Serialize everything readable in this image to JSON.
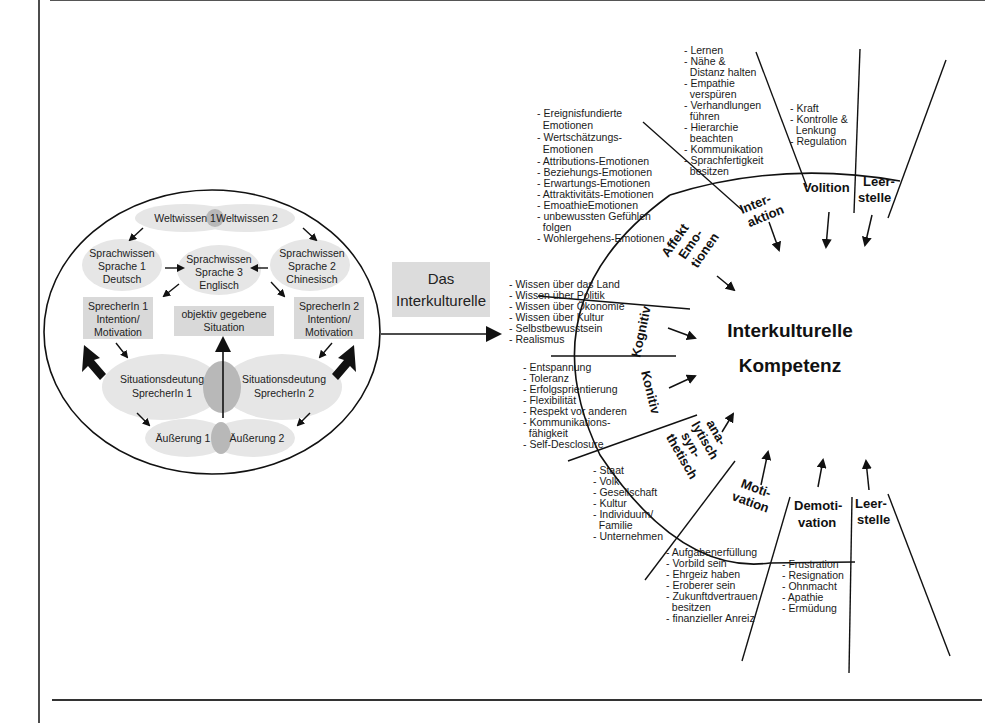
{
  "left_diagram": {
    "weltwissen_1": "Weltwissen 1",
    "weltwissen_2": "Weltwissen 2",
    "sprachwissen_1": [
      "Sprachwissen",
      "Sprache 1",
      "Deutsch"
    ],
    "sprachwissen_3": [
      "Sprachwissen",
      "Sprache 3",
      "Englisch"
    ],
    "sprachwissen_2": [
      "Sprachwissen",
      "Sprache 2",
      "Chinesisch"
    ],
    "sprecherin_1": [
      "SprecherIn 1",
      "Intention/",
      "Motivation"
    ],
    "situation": [
      "objektiv gegebene",
      "Situation"
    ],
    "sprecherin_2": [
      "SprecherIn 2",
      "Intention/",
      "Motivation"
    ],
    "deutung_1": [
      "Situationsdeutung",
      "SprecherIn 1"
    ],
    "deutung_2": [
      "Situationsdeutung",
      "SprecherIn 2"
    ],
    "aeusserung_1": "Äußerung 1",
    "aeusserung_2": "Äußerung 2"
  },
  "connector": {
    "label": [
      "Das",
      "Interkulturelle"
    ]
  },
  "center": {
    "title": [
      "Interkulturelle",
      "Kompetenz"
    ]
  },
  "segments": {
    "kognitiv": "Kognitiv",
    "konitiv": "Konitiv",
    "affekt": [
      "Affekt",
      "Emo-",
      "tionen"
    ],
    "interaktion": [
      "Inter-",
      "aktion"
    ],
    "volition": "Volition",
    "leerstelle_top": [
      "Leer-",
      "stelle"
    ],
    "analytisch": [
      "ana-",
      "lytisch",
      "syn-",
      "thetisch"
    ],
    "motivation": [
      "Moti-",
      "vation"
    ],
    "demotivation": [
      "Demoti-",
      "vation"
    ],
    "leerstelle_bottom": [
      "Leer-",
      "stelle"
    ]
  },
  "lists": {
    "affekt": [
      "- Ereignisfundierte",
      "  Emotionen",
      "- Wertschätzungs-",
      "  Emotionen",
      "- Attributions-Emotionen",
      "- Beziehungs-Emotionen",
      "- Erwartungs-Emotionen",
      "- Attraktivitäts-Emotionen",
      "- EmoathieEmotionen",
      "- unbewussten Gefühlen",
      "  folgen",
      "- Wohlergehens-Emotionen"
    ],
    "interaktion": [
      "- Lernen",
      "- Nähe &",
      "  Distanz halten",
      "- Empathie",
      "  verspüren",
      "- Verhandlungen",
      "  führen",
      "- Hierarchie",
      "  beachten",
      "- Kommunikation",
      "- Sprachfertigkeit",
      "  besitzen"
    ],
    "volition": [
      "- Kraft",
      "- Kontrolle &",
      "  Lenkung",
      "- Regulation"
    ],
    "kognitiv": [
      "- Wissen über das Land",
      "- Wissen über Politik",
      "- Wissen über Ökonomie",
      "- Wissen über Kultur",
      "- Selbstbewusstsein",
      "- Realismus"
    ],
    "konitiv": [
      "- Entspannung",
      "- Toleranz",
      "- Erfolgsprientierung",
      "- Flexibilität",
      "- Respekt vor anderen",
      "- Kommunikations-",
      "  fähigkeit",
      "- Self-Desclosure"
    ],
    "analytisch": [
      "- Staat",
      "- Volk",
      "- Gesellschaft",
      "- Kultur",
      "- Individuum/",
      "  Familie",
      "- Unternehmen"
    ],
    "motivation": [
      "- Aufgabenerfüllung",
      "- Vorbild sein",
      "- Ehrgeiz haben",
      "- Eroberer sein",
      "- Zukunftdvertrauen",
      "  besitzen",
      "- finanzieller Anreiz"
    ],
    "demotivation": [
      "- Frustration",
      "- Resignation",
      "- Ohnmacht",
      "- Apathie",
      "- Ermüdung"
    ]
  },
  "colors": {
    "line": "#111111",
    "ellipse_fill": "#e6e6e6",
    "overlap_fill": "#b8b8b8",
    "box_fill": "#d9d9d9"
  }
}
